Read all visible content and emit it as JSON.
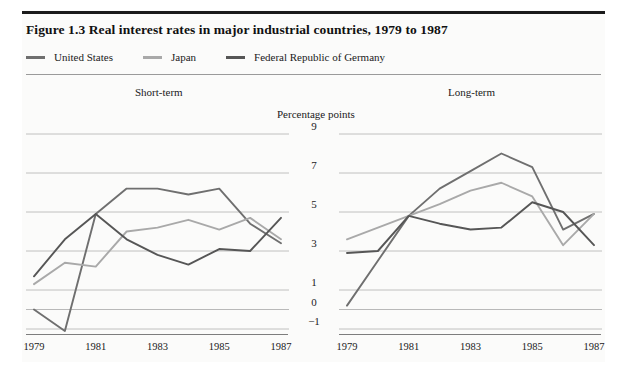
{
  "figure": {
    "title": "Figure 1.3  Real interest rates in major industrial countries, 1979 to 1987"
  },
  "legend": {
    "position": "top-left",
    "items": [
      {
        "label": "United States",
        "color": "#6f6f6f",
        "swatch_name": "legend-swatch-united-states"
      },
      {
        "label": "Japan",
        "color": "#a9a9a9",
        "swatch_name": "legend-swatch-japan"
      },
      {
        "label": "Federal Republic of Germany",
        "color": "#565656",
        "swatch_name": "legend-swatch-germany"
      }
    ]
  },
  "panels": {
    "short_term_title": "Short-term",
    "long_term_title": "Long-term"
  },
  "axis": {
    "unit_label": "Percentage points",
    "y_ticks": [
      "9",
      "7",
      "5",
      "3",
      "1",
      "0",
      "-1"
    ],
    "y_tick_values": [
      9,
      7,
      5,
      3,
      1,
      0,
      -1
    ],
    "x_ticks": [
      "1979",
      "1981",
      "1983",
      "1985",
      "1987"
    ],
    "x_tick_values": [
      1979,
      1981,
      1983,
      1985,
      1987
    ]
  },
  "chart_data": [
    {
      "type": "line",
      "title": "Short-term",
      "subtitle": "Real interest rates in major industrial countries, 1979 to 1987",
      "xlabel": "",
      "ylabel": "Percentage points",
      "x": [
        1979,
        1980,
        1981,
        1982,
        1983,
        1984,
        1985,
        1986,
        1987
      ],
      "xlim": [
        1979,
        1987
      ],
      "ylim": [
        -1,
        9
      ],
      "yticks": [
        -1,
        0,
        1,
        3,
        5,
        7,
        9
      ],
      "grid": true,
      "legend_position": "top-left",
      "series": [
        {
          "name": "United States",
          "color": "#6f6f6f",
          "values": [
            0.0,
            -1.1,
            4.9,
            6.2,
            6.2,
            5.9,
            6.2,
            4.4,
            3.4
          ]
        },
        {
          "name": "Japan",
          "color": "#a9a9a9",
          "values": [
            1.3,
            2.4,
            2.2,
            4.0,
            4.2,
            4.6,
            4.1,
            4.7,
            3.6
          ]
        },
        {
          "name": "Federal Republic of Germany",
          "color": "#565656",
          "values": [
            1.7,
            3.6,
            4.9,
            3.6,
            2.8,
            2.3,
            3.1,
            3.0,
            4.7
          ]
        }
      ]
    },
    {
      "type": "line",
      "title": "Long-term",
      "subtitle": "Real interest rates in major industrial countries, 1979 to 1987",
      "xlabel": "",
      "ylabel": "Percentage points",
      "x": [
        1979,
        1980,
        1981,
        1982,
        1983,
        1984,
        1985,
        1986,
        1987
      ],
      "xlim": [
        1979,
        1987
      ],
      "ylim": [
        -1,
        9
      ],
      "yticks": [
        -1,
        0,
        1,
        3,
        5,
        7,
        9
      ],
      "grid": true,
      "legend_position": "top-left",
      "series": [
        {
          "name": "United States",
          "color": "#6f6f6f",
          "values": [
            0.2,
            2.5,
            4.8,
            6.2,
            7.1,
            8.0,
            7.3,
            4.1,
            4.9
          ]
        },
        {
          "name": "Japan",
          "color": "#a9a9a9",
          "values": [
            3.6,
            4.2,
            4.8,
            5.4,
            6.1,
            6.5,
            5.8,
            3.3,
            4.9
          ]
        },
        {
          "name": "Federal Republic of Germany",
          "color": "#565656",
          "values": [
            2.9,
            3.0,
            4.8,
            4.4,
            4.1,
            4.2,
            5.5,
            5.0,
            3.3
          ]
        }
      ]
    }
  ],
  "style": {
    "gridline_color": "#b9b9b9",
    "axis_color": "#7d7d7d",
    "background": "#fbfbfa",
    "text_color": "#1a1a1a"
  }
}
